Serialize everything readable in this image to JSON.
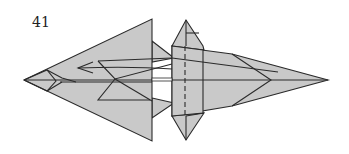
{
  "diagram": {
    "step_number": "41",
    "colors": {
      "paper": "#c9c9c9",
      "line": "#2a2a2a",
      "background": "#ffffff"
    },
    "elements": [
      {
        "name": "large-left-flap",
        "type": "triangle"
      },
      {
        "name": "body-center-strip",
        "type": "polygon"
      },
      {
        "name": "top-fin",
        "type": "triangle"
      },
      {
        "name": "bottom-fin",
        "type": "triangle"
      },
      {
        "name": "right-point",
        "type": "triangle"
      },
      {
        "name": "valley-fold-line",
        "type": "dashed-line"
      },
      {
        "name": "fold-direction-arrow",
        "type": "arrow",
        "direction": "left"
      }
    ]
  }
}
